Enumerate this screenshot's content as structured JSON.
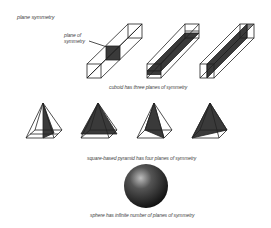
{
  "title": "plane symmetry",
  "callout": {
    "line1": "plane of",
    "line2": "symmetry"
  },
  "sections": [
    {
      "shape": "cuboid",
      "count": 3,
      "caption": "cuboid has three planes of symmetry"
    },
    {
      "shape": "square-based pyramid",
      "count": 4,
      "caption": "square-based pyramid has four planes of symmetry"
    },
    {
      "shape": "sphere",
      "count": 1,
      "caption": "sphere has infinite number of planes of symmetry"
    }
  ],
  "colors": {
    "line": "#222222",
    "plane_fill": "#3a3a3a",
    "sphere_dark": "#111111",
    "sphere_light": "#bdbdbd",
    "text": "#444444"
  }
}
